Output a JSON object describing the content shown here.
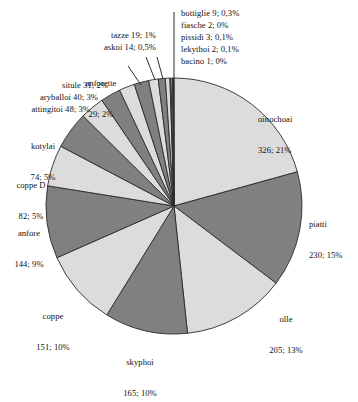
{
  "chart_data": {
    "type": "pie",
    "title": "",
    "subtitle": "",
    "xlabel": "",
    "ylabel": "",
    "legend_position": "none",
    "grid": false,
    "total": 1576,
    "start_angle_deg": 0,
    "direction": "clockwise",
    "categories": [
      "oinochoai",
      "piatti",
      "olle",
      "skyphoi",
      "coppe",
      "anfore",
      "coppe D",
      "kotylai",
      "attingitoi",
      "aryballoi",
      "situle",
      "anforette",
      "tazze",
      "askoi",
      "bottiglie",
      "fiasche",
      "pissidi",
      "lekythoi",
      "bacino"
    ],
    "values": [
      326,
      230,
      205,
      165,
      151,
      144,
      82,
      74,
      48,
      40,
      31,
      29,
      19,
      14,
      9,
      2,
      3,
      2,
      1
    ],
    "percent_labels": [
      "21%",
      "15%",
      "13%",
      "10%",
      "10%",
      "9%",
      "5%",
      "5%",
      "3%",
      "3%",
      "2%",
      "2%",
      "1%",
      "0,5%",
      "0,3%",
      "0%",
      "0,1%",
      "0,1%",
      "0%"
    ],
    "slice_colors": [
      "#dcdcdc",
      "#808080",
      "#dcdcdc",
      "#808080",
      "#dcdcdc",
      "#808080",
      "#dcdcdc",
      "#808080",
      "#dcdcdc",
      "#808080",
      "#dcdcdc",
      "#808080",
      "#dcdcdc",
      "#808080",
      "#dcdcdc",
      "#808080",
      "#dcdcdc",
      "#808080",
      "#dcdcdc"
    ],
    "colors": {
      "light_slice": "#dcdcdc",
      "dark_slice": "#808080",
      "slice_border": "#2b2b2b",
      "background": "#ffffff",
      "text": "#111111",
      "leader_line": "#2b2b2b"
    }
  },
  "labels": {
    "oinochoai": {
      "name": "oinochoai",
      "value": "326; 21%"
    },
    "piatti": {
      "name": "piatti",
      "value": "230; 15%"
    },
    "olle": {
      "name": "olle",
      "value": "205; 13%"
    },
    "skyphoi": {
      "name": "skyphoi",
      "value": "165; 10%"
    },
    "coppe": {
      "name": "coppe",
      "value": "151; 10%"
    },
    "anfore": {
      "name": "anfore",
      "value": "144; 9%"
    },
    "coppe_d": {
      "name": "coppe D",
      "value": "82; 5%"
    },
    "kotylai": {
      "name": "kotylai",
      "value": "74; 5%"
    },
    "attingitoi": {
      "name": "attingitoi 48; 3%"
    },
    "aryballoi": {
      "name": "aryballoi 40; 3%"
    },
    "situle": {
      "name": "situle 31; 2%"
    },
    "anforette": {
      "name": "anforette",
      "value": "29; 2%"
    },
    "askoi": {
      "name": "askoi 14; 0,5%"
    },
    "tazze": {
      "name": "tazze 19; 1%"
    },
    "bottiglie": {
      "name": "bottiglie 9; 0,3%"
    },
    "fiasche": {
      "name": "fiasche 2; 0%"
    },
    "pissidi": {
      "name": "pissidi 3; 0,1%"
    },
    "lekythoi": {
      "name": "lekythoi 2; 0,1%"
    },
    "bacino": {
      "name": "bacino 1; 0%"
    }
  }
}
